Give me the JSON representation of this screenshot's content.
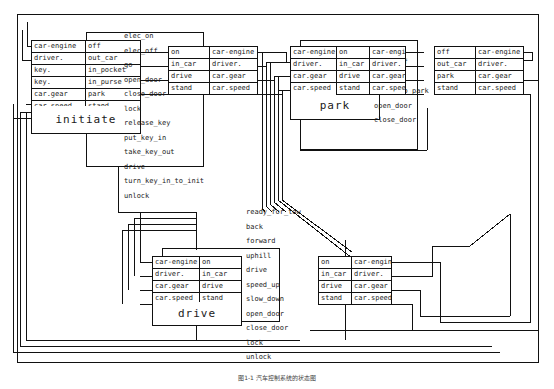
{
  "figure": {
    "caption": "图1-1  汽车控制系统的状态图",
    "outer_frame": true
  },
  "states": [
    {
      "id": "initiate",
      "name": "initiate",
      "attributes": [
        {
          "key": "car-engine",
          "value": "off"
        },
        {
          "key": "driver.",
          "value": "out_car"
        },
        {
          "key": "key.",
          "value": "in_pocket"
        },
        {
          "key": "key.",
          "value": "in_purse"
        },
        {
          "key": "car.gear",
          "value": "park"
        },
        {
          "key": "car.speed",
          "value": "stand"
        }
      ],
      "events": [
        "elec_on",
        "elec_off",
        "go",
        "open_door",
        "close_door",
        "lock",
        "release_key",
        "put_key_in",
        "take_key_out",
        "drive",
        "turn_key_in_to_init",
        "unlock"
      ]
    },
    {
      "id": "park",
      "name": "park",
      "attributes": [
        {
          "key": "car-engine",
          "value": "on"
        },
        {
          "key": "driver.",
          "value": "in_car"
        },
        {
          "key": "car.gear",
          "value": "drive"
        },
        {
          "key": "car.speed",
          "value": "stand"
        }
      ],
      "events": [
        "turn_off",
        "get_off",
        "ready_to_park",
        "open_door",
        "close_door"
      ]
    },
    {
      "id": "drive",
      "name": "drive",
      "attributes": [
        {
          "key": "car-engine",
          "value": "on"
        },
        {
          "key": "driver.",
          "value": "in_car"
        },
        {
          "key": "car.gear",
          "value": "drive"
        },
        {
          "key": "car.speed",
          "value": "stand"
        }
      ],
      "events": [
        "ready_for_tow",
        "back",
        "forward",
        "uphill",
        "drive",
        "speed_up",
        "slow_down",
        "open_door",
        "close_door",
        "lock",
        "unlock"
      ]
    }
  ],
  "port_tables": [
    {
      "id": "initiate-out-top",
      "columns_order": "value-key",
      "rows": [
        {
          "left": "on",
          "right": "car-engine"
        },
        {
          "left": "in_car",
          "right": "driver."
        },
        {
          "left": "drive",
          "right": "car.gear"
        },
        {
          "left": "stand",
          "right": "car.speed"
        }
      ]
    },
    {
      "id": "park-in-left",
      "columns_order": "key-value",
      "rows": [
        {
          "left": "car-engine",
          "right": "on"
        },
        {
          "left": "driver.",
          "right": "in_car"
        },
        {
          "left": "car.gear",
          "right": "drive"
        },
        {
          "left": "car.speed",
          "right": "stand"
        }
      ]
    },
    {
      "id": "park-out-right",
      "columns_order": "value-key",
      "rows": [
        {
          "left": "on",
          "right": "car-engine"
        },
        {
          "left": "in_car",
          "right": "driver."
        },
        {
          "left": "drive",
          "right": "car.gear"
        },
        {
          "left": "stand",
          "right": "car.speed"
        }
      ]
    },
    {
      "id": "far-right-top",
      "columns_order": "value-key",
      "rows": [
        {
          "left": "off",
          "right": "car-engine"
        },
        {
          "left": "out_car",
          "right": "driver."
        },
        {
          "left": "park",
          "right": "car.gear"
        },
        {
          "left": "stand",
          "right": "car.speed"
        }
      ]
    },
    {
      "id": "drive-in-left",
      "columns_order": "key-value",
      "rows": [
        {
          "left": "car-engine",
          "right": "on"
        },
        {
          "left": "driver.",
          "right": "in_car"
        },
        {
          "left": "car.gear",
          "right": "drive"
        },
        {
          "left": "car.speed",
          "right": "stand"
        }
      ]
    },
    {
      "id": "drive-out-right",
      "columns_order": "value-key",
      "rows": [
        {
          "left": "on",
          "right": "car-engine"
        },
        {
          "left": "in_car",
          "right": "driver."
        },
        {
          "left": "drive",
          "right": "car.gear"
        },
        {
          "left": "stand",
          "right": "car.speed"
        }
      ]
    }
  ],
  "colors": {
    "line": "#111111",
    "text": "#1a1a1a",
    "background": "#ffffff"
  }
}
